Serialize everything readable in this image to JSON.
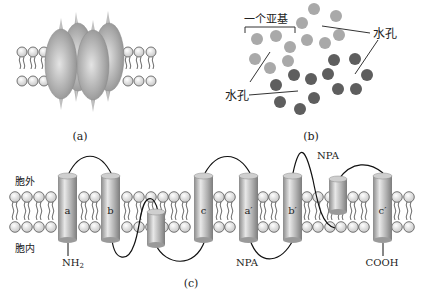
{
  "figure": {
    "panels": [
      {
        "id": "a",
        "caption": "(a)",
        "description": "aquaporin tetramer embedded in lipid bilayer"
      },
      {
        "id": "b",
        "caption": "(b)",
        "description": "top view of tetramer subunit helices"
      },
      {
        "id": "c",
        "caption": "(c)",
        "description": "membrane topology of one aquaporin subunit"
      }
    ]
  },
  "panel_a": {
    "caption": "(a)"
  },
  "panel_b": {
    "caption": "(b)",
    "subunit_label": "一个亚基",
    "pore_label_left": "水孔",
    "pore_label_right": "水孔",
    "colors": {
      "light": "#a9a9a9",
      "dark": "#5e5e5e"
    }
  },
  "panel_c": {
    "caption": "(c)",
    "extracellular_label": "胞外",
    "intracellular_label": "胞内",
    "n_terminus": "NH2",
    "n_terminus_main": "NH",
    "n_terminus_sub": "2",
    "c_terminus": "COOH",
    "npa_top": "NPA",
    "npa_bottom": "NPA",
    "helices": [
      {
        "label": "a"
      },
      {
        "label": "b"
      },
      {
        "label": "c"
      },
      {
        "label": "a′"
      },
      {
        "label": "b′"
      },
      {
        "label": "c′"
      }
    ]
  }
}
